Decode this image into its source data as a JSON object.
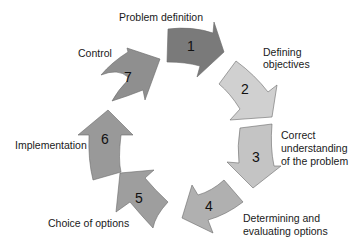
{
  "diagram": {
    "type": "cycle",
    "steps": [
      {
        "number": "1",
        "label": "Problem definition",
        "color": "#7a7a7a"
      },
      {
        "number": "2",
        "label": "Defining objectives",
        "color": "#d0d0d0"
      },
      {
        "number": "3",
        "label": "Correct understanding of the problem",
        "color": "#c4c4c4"
      },
      {
        "number": "4",
        "label": "Determining and evaluating options",
        "color": "#b0b0b0"
      },
      {
        "number": "5",
        "label": "Choice of options",
        "color": "#9e9e9e"
      },
      {
        "number": "6",
        "label": "Implementation",
        "color": "#999999"
      },
      {
        "number": "7",
        "label": "Control",
        "color": "#8f8f8f"
      }
    ],
    "labels": {
      "l1": "Problem definition",
      "l2a": "Defining",
      "l2b": "objectives",
      "l3a": "Correct",
      "l3b": "understanding",
      "l3c": "of the problem",
      "l4a": "Determining and",
      "l4b": "evaluating options",
      "l5": "Choice of options",
      "l6": "Implementation",
      "l7": "Control"
    }
  }
}
